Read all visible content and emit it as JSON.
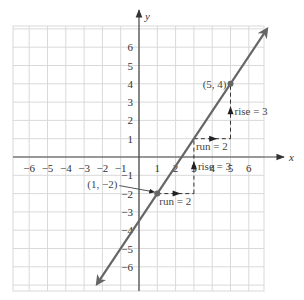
{
  "chart_data": {
    "type": "line",
    "title": "",
    "xlabel": "x",
    "ylabel": "y",
    "xlim": [
      -6.9,
      6.9
    ],
    "ylim": [
      -7.2,
      7.2
    ],
    "grid": true,
    "x_ticks": [
      -6,
      -5,
      -4,
      -3,
      -2,
      -1,
      1,
      2,
      3,
      4,
      5,
      6
    ],
    "y_ticks": [
      6,
      5,
      4,
      3,
      2,
      1,
      -1,
      -2,
      -3,
      -4,
      -5,
      -6
    ],
    "x_tick_labels": [
      "−6",
      "−5",
      "−4",
      "−3",
      "−2",
      "−1",
      "1",
      "2",
      "3",
      "4",
      "5",
      "6"
    ],
    "y_tick_labels": [
      "6",
      "5",
      "4",
      "3",
      "2",
      "1",
      "−1",
      "−2",
      "−3",
      "−4",
      "−5",
      "−6"
    ],
    "series": [
      {
        "name": "line",
        "slope": 1.5,
        "intercept": -3.5,
        "x_range": [
          -2.3,
          7.0
        ],
        "arrows": "both",
        "color": "#666666"
      }
    ],
    "points": [
      {
        "x": 5,
        "y": 4,
        "label": "(5, 4)"
      },
      {
        "x": 1,
        "y": -2,
        "label": "(1, −2)"
      }
    ],
    "annotations": [
      {
        "type": "run",
        "from": [
          3,
          1
        ],
        "to": [
          5,
          1
        ],
        "label": "run = 2"
      },
      {
        "type": "rise",
        "from": [
          5,
          1
        ],
        "to": [
          5,
          4
        ],
        "label": "rise = 3"
      },
      {
        "type": "run",
        "from": [
          1,
          -2
        ],
        "to": [
          3,
          -2
        ],
        "label": "run = 2"
      },
      {
        "type": "rise",
        "from": [
          3,
          -2
        ],
        "to": [
          3,
          1
        ],
        "label": "rise = 3"
      }
    ]
  }
}
